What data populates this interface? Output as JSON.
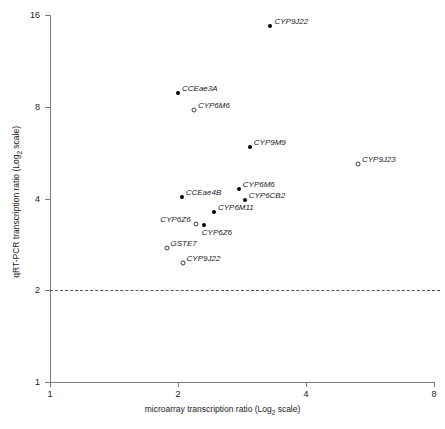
{
  "chart_data": {
    "type": "scatter",
    "title": "",
    "xlabel": "microarray transcription ratio (Log2 scale)",
    "ylabel": "qRT-PCR transcription ratio (Log2 scale)",
    "xlabel_prefix": "microarray transcription ratio (Log",
    "xlabel_sub": "2",
    "xlabel_suffix": " scale)",
    "ylabel_prefix": "qRT-PCR transcription ratio (Log",
    "ylabel_sub": "2",
    "ylabel_suffix": " scale)",
    "x_scale": "log2",
    "y_scale": "log2",
    "xlim": [
      1,
      8
    ],
    "ylim": [
      1,
      16
    ],
    "xticks": [
      "1",
      "2",
      "4",
      "8"
    ],
    "xtick_values": [
      1,
      2,
      4,
      8
    ],
    "yticks": [
      "1",
      "2",
      "4",
      "8",
      "16"
    ],
    "ytick_values": [
      1,
      2,
      4,
      8,
      16
    ],
    "grid": false,
    "legend": "none",
    "annotations": [
      {
        "type": "hline",
        "name": "threshold-line",
        "y": 2,
        "style": "dashed",
        "color": "#555555"
      }
    ],
    "marker_styles": {
      "filled": "filled black circle",
      "open": "open circle"
    },
    "points": [
      {
        "label": "CYP9J22",
        "x": 3.3,
        "y": 14.7,
        "marker": "filled",
        "label_pos": "right"
      },
      {
        "label": "CCEae3A",
        "x": 2.0,
        "y": 8.9,
        "marker": "filled",
        "label_pos": "right"
      },
      {
        "label": "CYP6M6",
        "x": 2.18,
        "y": 7.8,
        "marker": "open",
        "label_pos": "right"
      },
      {
        "label": "CYP9M9",
        "x": 2.95,
        "y": 5.9,
        "marker": "filled",
        "label_pos": "right"
      },
      {
        "label": "CYP9J23",
        "x": 5.3,
        "y": 5.2,
        "marker": "open",
        "label_pos": "right"
      },
      {
        "label": "CCEae4B",
        "x": 2.04,
        "y": 4.05,
        "marker": "filled",
        "label_pos": "right"
      },
      {
        "label": "CYP6M6",
        "x": 2.78,
        "y": 4.3,
        "marker": "filled",
        "label_pos": "right"
      },
      {
        "label": "CYP6CB2",
        "x": 2.87,
        "y": 3.95,
        "marker": "filled",
        "label_pos": "right"
      },
      {
        "label": "CYP6M11",
        "x": 2.43,
        "y": 3.6,
        "marker": "filled",
        "label_pos": "right"
      },
      {
        "label": "CYP6Z6",
        "x": 2.2,
        "y": 3.3,
        "marker": "open",
        "label_pos": "left"
      },
      {
        "label": "CYP6Z6",
        "x": 2.3,
        "y": 3.27,
        "marker": "filled",
        "label_pos": "below"
      },
      {
        "label": "GSTE7",
        "x": 1.88,
        "y": 2.75,
        "marker": "open",
        "label_pos": "right"
      },
      {
        "label": "CYP9J22",
        "x": 2.05,
        "y": 2.45,
        "marker": "open",
        "label_pos": "right"
      }
    ]
  }
}
